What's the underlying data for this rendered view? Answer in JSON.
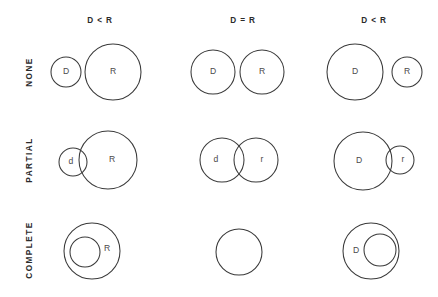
{
  "figure": {
    "title": "",
    "width": 438,
    "height": 297,
    "background_color": "#ffffff",
    "stroke_color": "#3a3a3a",
    "text_color": "#2b2b2b",
    "label_color": "#4a4a4a"
  },
  "column_headers": [
    {
      "id": "col-1",
      "label": "D < R",
      "x": 100
    },
    {
      "id": "col-2",
      "label": "D = R",
      "x": 243
    },
    {
      "id": "col-3",
      "label": "D < R",
      "x": 374
    }
  ],
  "row_labels": [
    {
      "id": "row-none",
      "label": "NONE",
      "y": 72
    },
    {
      "id": "row-partial",
      "label": "PARTIAL",
      "y": 160
    },
    {
      "id": "row-complete",
      "label": "COMPLETE",
      "y": 250
    }
  ],
  "cells": [
    {
      "id": "cell-none-1",
      "row": "NONE",
      "column": "D < R",
      "overlap": "none",
      "circles": [
        {
          "name": "circle-d",
          "label": "D",
          "cx": 66,
          "cy": 72,
          "r": 15,
          "label_dx": 0,
          "label_dy": 0
        },
        {
          "name": "circle-r",
          "label": "R",
          "cx": 113,
          "cy": 72,
          "r": 28,
          "label_dx": 0,
          "label_dy": 0
        }
      ]
    },
    {
      "id": "cell-none-2",
      "row": "NONE",
      "column": "D = R",
      "overlap": "none",
      "circles": [
        {
          "name": "circle-d",
          "label": "D",
          "cx": 213,
          "cy": 72,
          "r": 22,
          "label_dx": 0,
          "label_dy": 0
        },
        {
          "name": "circle-r",
          "label": "R",
          "cx": 262,
          "cy": 72,
          "r": 22,
          "label_dx": 0,
          "label_dy": 0
        }
      ]
    },
    {
      "id": "cell-none-3",
      "row": "NONE",
      "column": "D < R",
      "overlap": "none",
      "circles": [
        {
          "name": "circle-d",
          "label": "D",
          "cx": 355,
          "cy": 72,
          "r": 28,
          "label_dx": 0,
          "label_dy": 0
        },
        {
          "name": "circle-r",
          "label": "R",
          "cx": 407,
          "cy": 72,
          "r": 15,
          "label_dx": 0,
          "label_dy": 0
        }
      ]
    },
    {
      "id": "cell-partial-1",
      "row": "PARTIAL",
      "column": "D < R",
      "overlap": "partial",
      "circles": [
        {
          "name": "circle-d",
          "label": "d",
          "cx": 73,
          "cy": 162,
          "r": 14,
          "label_dx": -2,
          "label_dy": 0
        },
        {
          "name": "circle-r",
          "label": "R",
          "cx": 108,
          "cy": 160,
          "r": 29,
          "label_dx": 4,
          "label_dy": 0
        }
      ]
    },
    {
      "id": "cell-partial-2",
      "row": "PARTIAL",
      "column": "D = R",
      "overlap": "partial",
      "circles": [
        {
          "name": "circle-d",
          "label": "d",
          "cx": 222,
          "cy": 160,
          "r": 22,
          "label_dx": -6,
          "label_dy": 0
        },
        {
          "name": "circle-r",
          "label": "r",
          "cx": 256,
          "cy": 160,
          "r": 22,
          "label_dx": 6,
          "label_dy": 0
        }
      ]
    },
    {
      "id": "cell-partial-3",
      "row": "PARTIAL",
      "column": "D < R",
      "overlap": "partial",
      "circles": [
        {
          "name": "circle-d",
          "label": "D",
          "cx": 363,
          "cy": 161,
          "r": 29,
          "label_dx": -4,
          "label_dy": 0
        },
        {
          "name": "circle-r",
          "label": "r",
          "cx": 400,
          "cy": 160,
          "r": 14,
          "label_dx": 3,
          "label_dy": 0
        }
      ]
    },
    {
      "id": "cell-complete-1",
      "row": "COMPLETE",
      "column": "D < R",
      "overlap": "complete",
      "circles": [
        {
          "name": "circle-r",
          "label": "R",
          "cx": 92,
          "cy": 251,
          "r": 28,
          "label_dx": 15,
          "label_dy": -2
        },
        {
          "name": "circle-d",
          "label": "",
          "cx": 85,
          "cy": 252,
          "r": 15,
          "label_dx": 0,
          "label_dy": 0
        }
      ]
    },
    {
      "id": "cell-complete-2",
      "row": "COMPLETE",
      "column": "D = R",
      "overlap": "complete",
      "circles": [
        {
          "name": "circle-dr",
          "label": "",
          "cx": 239,
          "cy": 252,
          "r": 23,
          "label_dx": 0,
          "label_dy": 0
        }
      ]
    },
    {
      "id": "cell-complete-3",
      "row": "COMPLETE",
      "column": "D < R",
      "overlap": "complete",
      "circles": [
        {
          "name": "circle-d",
          "label": "D",
          "cx": 371,
          "cy": 251,
          "r": 28,
          "label_dx": -15,
          "label_dy": 0
        },
        {
          "name": "circle-r",
          "label": "",
          "cx": 380,
          "cy": 250,
          "r": 16,
          "label_dx": 0,
          "label_dy": 0
        }
      ]
    }
  ]
}
